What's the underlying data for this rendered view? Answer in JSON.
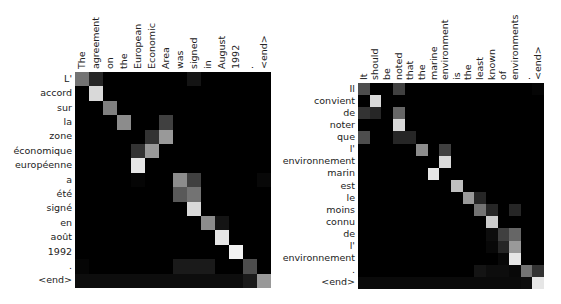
{
  "chart_data": [
    {
      "type": "heatmap",
      "title": "",
      "xlabel": "",
      "ylabel": "",
      "grid": false,
      "colormap": "gray",
      "x": [
        "The",
        "agreement",
        "on",
        "the",
        "European",
        "Economic",
        "Area",
        "was",
        "signed",
        "in",
        "August",
        "1992",
        ".",
        "<end>"
      ],
      "y": [
        "L'",
        "accord",
        "sur",
        "la",
        "zone",
        "économique",
        "européenne",
        "a",
        "été",
        "signé",
        "en",
        "août",
        "1992",
        ".",
        "<end>"
      ],
      "values": [
        [
          0.45,
          0.15,
          0,
          0,
          0,
          0,
          0,
          0,
          0.08,
          0,
          0,
          0,
          0,
          0
        ],
        [
          0,
          0.85,
          0,
          0,
          0,
          0,
          0,
          0,
          0,
          0,
          0,
          0,
          0,
          0
        ],
        [
          0,
          0,
          0.5,
          0,
          0,
          0,
          0,
          0,
          0,
          0,
          0,
          0,
          0,
          0
        ],
        [
          0,
          0,
          0,
          0.55,
          0,
          0,
          0.25,
          0,
          0,
          0,
          0,
          0,
          0,
          0
        ],
        [
          0,
          0,
          0,
          0,
          0,
          0.2,
          0.6,
          0,
          0,
          0,
          0,
          0,
          0,
          0
        ],
        [
          0,
          0,
          0,
          0,
          0.2,
          0.6,
          0,
          0,
          0,
          0,
          0,
          0,
          0,
          0
        ],
        [
          0,
          0,
          0,
          0,
          0.9,
          0,
          0,
          0,
          0,
          0,
          0,
          0,
          0,
          0
        ],
        [
          0,
          0,
          0,
          0,
          0.02,
          0,
          0,
          0.55,
          0.25,
          0,
          0,
          0,
          0,
          0.03
        ],
        [
          0,
          0,
          0,
          0,
          0,
          0,
          0,
          0.35,
          0.45,
          0,
          0,
          0,
          0,
          0
        ],
        [
          0,
          0,
          0,
          0,
          0,
          0,
          0,
          0,
          0.85,
          0,
          0,
          0,
          0,
          0
        ],
        [
          0,
          0,
          0,
          0,
          0,
          0,
          0,
          0,
          0,
          0.55,
          0.08,
          0,
          0,
          0
        ],
        [
          0,
          0,
          0,
          0,
          0,
          0,
          0,
          0,
          0,
          0,
          0.9,
          0,
          0,
          0
        ],
        [
          0,
          0,
          0,
          0,
          0,
          0,
          0,
          0,
          0,
          0,
          0,
          0.95,
          0,
          0
        ],
        [
          0.02,
          0,
          0,
          0,
          0,
          0,
          0,
          0.1,
          0.1,
          0.1,
          0,
          0,
          0.3,
          0
        ],
        [
          0.05,
          0.05,
          0.05,
          0.05,
          0.05,
          0.05,
          0.05,
          0.05,
          0.05,
          0.05,
          0.05,
          0.05,
          0.1,
          0.6
        ]
      ]
    },
    {
      "type": "heatmap",
      "title": "",
      "xlabel": "",
      "ylabel": "",
      "grid": false,
      "colormap": "gray",
      "x": [
        "It",
        "should",
        "be",
        "noted",
        "that",
        "the",
        "marine",
        "environment",
        "is",
        "the",
        "least",
        "known",
        "of",
        "environments",
        ".",
        "<end>"
      ],
      "y": [
        "Il",
        "convient",
        "de",
        "noter",
        "que",
        "l'",
        "environnement",
        "marin",
        "est",
        "le",
        "moins",
        "connu",
        "de",
        "l'",
        "environnement",
        ".",
        "<end>"
      ],
      "values": [
        [
          0.3,
          0,
          0,
          0.25,
          0,
          0,
          0,
          0,
          0,
          0,
          0,
          0,
          0,
          0,
          0,
          0.02
        ],
        [
          0,
          0.85,
          0,
          0,
          0,
          0,
          0,
          0,
          0,
          0,
          0,
          0,
          0,
          0,
          0,
          0
        ],
        [
          0.2,
          0.15,
          0,
          0.4,
          0,
          0,
          0,
          0,
          0,
          0,
          0,
          0,
          0,
          0,
          0,
          0
        ],
        [
          0,
          0,
          0,
          0.85,
          0,
          0,
          0,
          0,
          0,
          0,
          0,
          0,
          0,
          0,
          0,
          0
        ],
        [
          0.3,
          0,
          0,
          0.15,
          0.15,
          0,
          0,
          0,
          0,
          0,
          0,
          0,
          0,
          0,
          0,
          0
        ],
        [
          0,
          0,
          0,
          0,
          0,
          0.55,
          0,
          0.25,
          0,
          0,
          0,
          0,
          0,
          0,
          0,
          0
        ],
        [
          0,
          0,
          0,
          0,
          0,
          0,
          0,
          0.85,
          0,
          0,
          0,
          0,
          0,
          0,
          0,
          0
        ],
        [
          0,
          0,
          0,
          0,
          0,
          0,
          0.9,
          0,
          0,
          0,
          0,
          0,
          0,
          0,
          0,
          0
        ],
        [
          0,
          0,
          0,
          0,
          0,
          0,
          0,
          0,
          0.75,
          0,
          0,
          0,
          0,
          0,
          0,
          0
        ],
        [
          0,
          0,
          0,
          0,
          0,
          0,
          0,
          0,
          0,
          0.6,
          0.15,
          0,
          0,
          0,
          0,
          0
        ],
        [
          0,
          0,
          0,
          0,
          0,
          0,
          0,
          0,
          0,
          0,
          0.45,
          0.15,
          0,
          0.15,
          0,
          0
        ],
        [
          0,
          0,
          0,
          0,
          0,
          0,
          0,
          0,
          0,
          0,
          0,
          0.8,
          0,
          0,
          0,
          0
        ],
        [
          0,
          0,
          0,
          0,
          0,
          0,
          0,
          0,
          0,
          0,
          0,
          0.05,
          0.25,
          0.4,
          0,
          0
        ],
        [
          0,
          0,
          0,
          0,
          0,
          0,
          0,
          0,
          0,
          0,
          0,
          0.03,
          0.15,
          0.6,
          0,
          0
        ],
        [
          0,
          0,
          0,
          0,
          0,
          0,
          0,
          0,
          0,
          0,
          0,
          0,
          0.03,
          0.9,
          0,
          0
        ],
        [
          0,
          0,
          0,
          0,
          0,
          0,
          0,
          0,
          0,
          0,
          0.08,
          0.05,
          0.05,
          0.03,
          0.45,
          0.2
        ],
        [
          0.04,
          0.04,
          0.04,
          0.04,
          0.04,
          0.04,
          0.04,
          0.04,
          0.04,
          0.04,
          0.04,
          0.04,
          0.04,
          0.04,
          0.05,
          0.9
        ]
      ]
    }
  ],
  "panels": [
    {
      "left": 75,
      "top": 72,
      "width": 196,
      "height": 216
    },
    {
      "left": 358,
      "top": 83,
      "width": 186,
      "height": 206
    }
  ]
}
